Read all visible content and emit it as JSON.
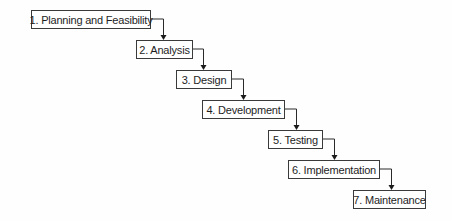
{
  "diagram": {
    "type": "waterfall-process",
    "steps": [
      {
        "label": "1. Planning and Feasibility",
        "x": 31,
        "y": 10,
        "w": 120,
        "h": 19
      },
      {
        "label": "2. Analysis",
        "x": 136,
        "y": 40,
        "w": 57,
        "h": 19
      },
      {
        "label": "3. Design",
        "x": 176,
        "y": 70,
        "w": 56,
        "h": 19
      },
      {
        "label": "4. Development",
        "x": 202,
        "y": 100,
        "w": 83,
        "h": 19
      },
      {
        "label": "5. Testing",
        "x": 268,
        "y": 130,
        "w": 55,
        "h": 19
      },
      {
        "label": "6. Implementation",
        "x": 288,
        "y": 160,
        "w": 92,
        "h": 19
      },
      {
        "label": "7. Maintenance",
        "x": 353,
        "y": 190,
        "w": 73,
        "h": 19
      }
    ],
    "connectors": [
      {
        "from": 0,
        "to": 1,
        "turn_x": 163
      },
      {
        "from": 1,
        "to": 2,
        "turn_x": 203
      },
      {
        "from": 2,
        "to": 3,
        "turn_x": 243
      },
      {
        "from": 3,
        "to": 4,
        "turn_x": 296
      },
      {
        "from": 4,
        "to": 5,
        "turn_x": 334
      },
      {
        "from": 5,
        "to": 6,
        "turn_x": 391
      }
    ],
    "colors": {
      "border": "#3a3a3a",
      "text": "#1e1e1e",
      "arrow": "#1a1a1a",
      "background": "#fefefe"
    }
  }
}
